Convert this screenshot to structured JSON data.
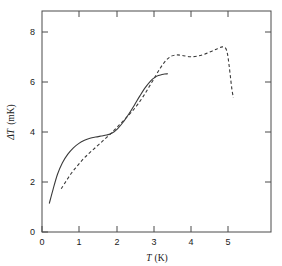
{
  "chart_data": {
    "type": "line",
    "title": "",
    "subtitle": "",
    "xlabel": "T (K)",
    "ylabel": "ΔT (mK)",
    "xlabel_parts": {
      "symbol": "T",
      "unit": "(K)"
    },
    "ylabel_parts": {
      "symbol": "ΔT",
      "unit": "(mK)"
    },
    "xlim": [
      0,
      6.2
    ],
    "ylim": [
      0,
      8.8
    ],
    "xticks": [
      0,
      1,
      2,
      3,
      4,
      5
    ],
    "yticks": [
      0,
      2,
      4,
      6,
      8
    ],
    "xticklabels": [
      "0",
      "1",
      "2",
      "3",
      "4",
      "5"
    ],
    "yticklabels": [
      "0",
      "2",
      "4",
      "6",
      "8"
    ],
    "grid": false,
    "legend": "none",
    "frame": "box",
    "tick_direction": "in",
    "line_color": "#3a3a3a",
    "background_color": "#ffffff",
    "series": [
      {
        "name": "solid-curve",
        "style": "solid",
        "x": [
          0.2,
          0.3,
          0.42,
          0.55,
          0.7,
          0.85,
          1.0,
          1.15,
          1.3,
          1.45,
          1.6,
          1.75,
          1.9,
          2.05,
          2.2,
          2.35,
          2.5,
          2.65,
          2.8,
          2.95,
          3.05,
          3.15,
          3.25,
          3.32,
          3.4
        ],
        "y": [
          1.15,
          1.7,
          2.3,
          2.75,
          3.1,
          3.35,
          3.53,
          3.65,
          3.73,
          3.78,
          3.82,
          3.86,
          3.94,
          4.12,
          4.38,
          4.7,
          5.05,
          5.42,
          5.76,
          6.03,
          6.15,
          6.23,
          6.27,
          6.29,
          6.3
        ]
      },
      {
        "name": "dashed-curve",
        "style": "dashed",
        "x": [
          0.52,
          0.65,
          0.8,
          0.95,
          1.1,
          1.25,
          1.4,
          1.55,
          1.7,
          1.85,
          2.0,
          2.15,
          2.3,
          2.45,
          2.6,
          2.75,
          2.9,
          3.05,
          3.2,
          3.35,
          3.5,
          3.65,
          3.8,
          4.0,
          4.2,
          4.4,
          4.6,
          4.75,
          4.88,
          4.97,
          5.02,
          5.06,
          5.1,
          5.14,
          5.18
        ],
        "y": [
          1.72,
          2.02,
          2.35,
          2.62,
          2.88,
          3.1,
          3.3,
          3.5,
          3.7,
          3.9,
          4.12,
          4.35,
          4.58,
          4.82,
          5.1,
          5.42,
          5.78,
          6.15,
          6.52,
          6.82,
          7.0,
          7.05,
          7.03,
          6.98,
          7.0,
          7.08,
          7.2,
          7.3,
          7.37,
          7.32,
          7.1,
          6.7,
          6.2,
          5.7,
          5.35
        ]
      }
    ],
    "annotations": []
  }
}
